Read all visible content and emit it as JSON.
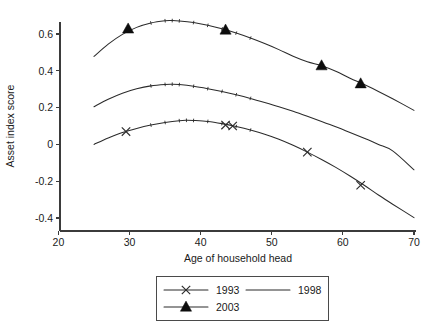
{
  "chart_data": {
    "type": "line",
    "title": "",
    "xlabel": "Age of household head",
    "ylabel": "Asset index score",
    "xlim": [
      20,
      70
    ],
    "ylim": [
      -0.45,
      0.7
    ],
    "xticks": [
      20,
      30,
      40,
      50,
      60,
      70
    ],
    "xticklabels": [
      "20",
      "30",
      "40",
      "50",
      "60",
      "70"
    ],
    "yticks": [
      -0.4,
      -0.2,
      0,
      0.2,
      0.4,
      0.6
    ],
    "yticklabels": [
      "-0.4",
      "-0.2",
      "0",
      "0.2",
      "0.4",
      "0.6"
    ],
    "grid": false,
    "legend_position": "below-center",
    "series": [
      {
        "name": "1993",
        "marker": "x",
        "x": [
          25,
          27,
          29,
          31,
          33,
          35,
          37,
          38,
          39,
          41,
          43,
          45,
          47,
          49,
          51,
          53,
          55,
          57,
          59,
          61,
          63,
          65,
          67,
          70
        ],
        "y": [
          0.0,
          0.035,
          0.065,
          0.087,
          0.105,
          0.119,
          0.129,
          0.131,
          0.13,
          0.125,
          0.113,
          0.097,
          0.078,
          0.055,
          0.028,
          -0.005,
          -0.042,
          -0.082,
          -0.125,
          -0.172,
          -0.222,
          -0.275,
          -0.325,
          -0.398
        ],
        "marker_points": [
          {
            "x": 29.5,
            "y": 0.07
          },
          {
            "x": 43.5,
            "y": 0.105
          },
          {
            "x": 44.5,
            "y": 0.1
          },
          {
            "x": 55.0,
            "y": -0.042
          },
          {
            "x": 62.5,
            "y": -0.222
          }
        ]
      },
      {
        "name": "1998",
        "marker": "none",
        "x": [
          25,
          27,
          29,
          31,
          33,
          35,
          36,
          37,
          39,
          41,
          43,
          45,
          47,
          49,
          51,
          53,
          55,
          57,
          59,
          61,
          63,
          65,
          67,
          70
        ],
        "y": [
          0.205,
          0.245,
          0.278,
          0.302,
          0.318,
          0.326,
          0.327,
          0.325,
          0.316,
          0.303,
          0.288,
          0.27,
          0.25,
          0.228,
          0.205,
          0.18,
          0.153,
          0.125,
          0.096,
          0.065,
          0.033,
          0.0,
          -0.035,
          -0.138
        ],
        "marker_points": []
      },
      {
        "name": "2003",
        "marker": "triangle",
        "x": [
          25,
          27,
          29,
          31,
          33,
          35,
          36,
          37,
          39,
          41,
          43,
          45,
          47,
          49,
          51,
          53,
          55,
          57,
          59,
          61,
          63,
          65,
          67,
          70
        ],
        "y": [
          0.478,
          0.545,
          0.598,
          0.636,
          0.66,
          0.672,
          0.673,
          0.671,
          0.662,
          0.647,
          0.628,
          0.605,
          0.578,
          0.548,
          0.515,
          0.479,
          0.449,
          0.428,
          0.398,
          0.36,
          0.325,
          0.288,
          0.248,
          0.185
        ],
        "marker_points": [
          {
            "x": 29.8,
            "y": 0.628
          },
          {
            "x": 43.5,
            "y": 0.622
          },
          {
            "x": 57.0,
            "y": 0.428
          },
          {
            "x": 62.5,
            "y": 0.33
          }
        ]
      }
    ]
  },
  "legend": {
    "entries": [
      {
        "label": "1993",
        "marker": "x"
      },
      {
        "label": "1998",
        "marker": "none"
      },
      {
        "label": "2003",
        "marker": "triangle"
      }
    ]
  },
  "colors": {
    "line": "#2b2b2b",
    "axis": "#3b3b3b",
    "text": "#1a1a1a",
    "background": "#ffffff"
  }
}
